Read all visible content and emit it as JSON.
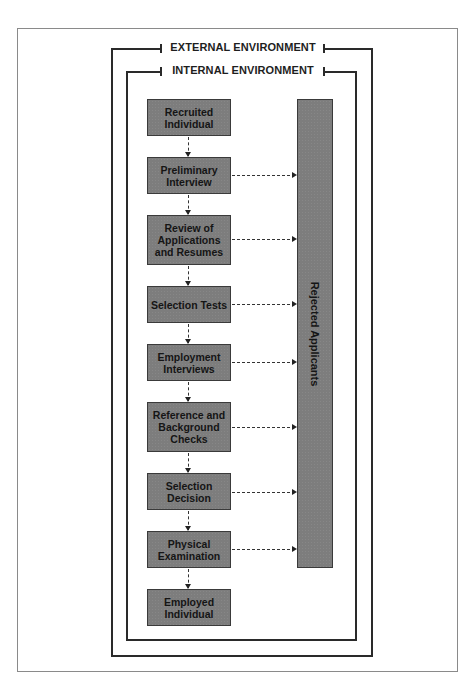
{
  "diagram": {
    "external_label": "EXTERNAL ENVIRONMENT",
    "internal_label": "INTERNAL ENVIRONMENT",
    "steps": [
      {
        "label": "Recruited Individual",
        "rejects": false
      },
      {
        "label": "Preliminary Interview",
        "rejects": true
      },
      {
        "label": "Review of Applications and Resumes",
        "rejects": true
      },
      {
        "label": "Selection Tests",
        "rejects": true
      },
      {
        "label": "Employment Interviews",
        "rejects": true
      },
      {
        "label": "Reference and Background Checks",
        "rejects": true
      },
      {
        "label": "Selection Decision",
        "rejects": true
      },
      {
        "label": "Physical Examination",
        "rejects": true
      },
      {
        "label": "Employed Individual",
        "rejects": false
      }
    ],
    "rejected_label": "Rejected Applicants",
    "colors": {
      "box_fill": "#7d7d7d",
      "box_border": "#3a3a3a",
      "line": "#2a2a2a",
      "frame": "#8a8a8a"
    }
  }
}
